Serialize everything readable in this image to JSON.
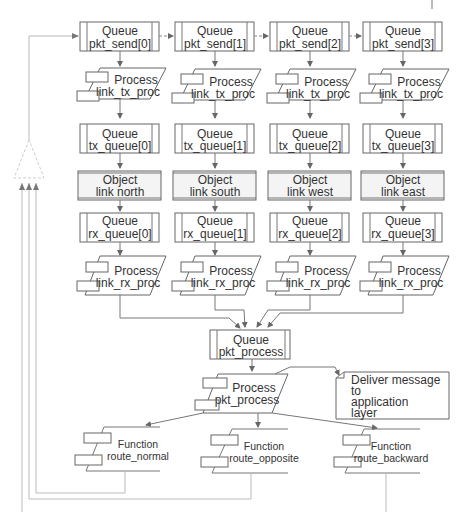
{
  "diagram": {
    "columns": [
      {
        "pkt_send": {
          "type": "Queue",
          "name": "pkt_send[0]"
        },
        "tx_proc": {
          "type": "Process",
          "name": "link_tx_proc"
        },
        "tx_queue": {
          "type": "Queue",
          "name": "tx_queue[0]"
        },
        "link": {
          "type": "Object",
          "name": "link north"
        },
        "rx_queue": {
          "type": "Queue",
          "name": "rx_queue[0]"
        },
        "rx_proc": {
          "type": "Process",
          "name": "link_rx_proc"
        }
      },
      {
        "pkt_send": {
          "type": "Queue",
          "name": "pkt_send[1]"
        },
        "tx_proc": {
          "type": "Process",
          "name": "link_tx_proc"
        },
        "tx_queue": {
          "type": "Queue",
          "name": "tx_queue[1]"
        },
        "link": {
          "type": "Object",
          "name": "link south"
        },
        "rx_queue": {
          "type": "Queue",
          "name": "rx_queue[1]"
        },
        "rx_proc": {
          "type": "Process",
          "name": "link_rx_proc"
        }
      },
      {
        "pkt_send": {
          "type": "Queue",
          "name": "pkt_send[2]"
        },
        "tx_proc": {
          "type": "Process",
          "name": "link_tx_proc"
        },
        "tx_queue": {
          "type": "Queue",
          "name": "tx_queue[2]"
        },
        "link": {
          "type": "Object",
          "name": "link west"
        },
        "rx_queue": {
          "type": "Queue",
          "name": "rx_queue[2]"
        },
        "rx_proc": {
          "type": "Process",
          "name": "link_rx_proc"
        }
      },
      {
        "pkt_send": {
          "type": "Queue",
          "name": "pkt_send[3]"
        },
        "tx_proc": {
          "type": "Process",
          "name": "link_tx_proc"
        },
        "tx_queue": {
          "type": "Queue",
          "name": "tx_queue[3]"
        },
        "link": {
          "type": "Object",
          "name": "link east"
        },
        "rx_queue": {
          "type": "Queue",
          "name": "rx_queue[3]"
        },
        "rx_proc": {
          "type": "Process",
          "name": "link_rx_proc"
        }
      }
    ],
    "pkt_process_queue": {
      "type": "Queue",
      "name": "pkt_process"
    },
    "pkt_process_proc": {
      "type": "Process",
      "name": "pkt_process"
    },
    "deliver_note": {
      "lines": [
        "Deliver message",
        "to",
        "application",
        "layer"
      ]
    },
    "functions": [
      {
        "type": "Function",
        "name": "route_normal"
      },
      {
        "type": "Function",
        "name": "route_opposite"
      },
      {
        "type": "Function",
        "name": "route_backward"
      }
    ]
  }
}
